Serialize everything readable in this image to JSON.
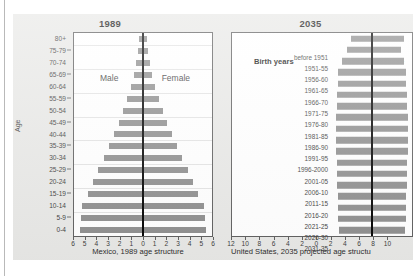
{
  "figure": {
    "background_color": "#e8e8e6",
    "bar_color": "#8d8d8d",
    "center_axis_color": "#000000"
  },
  "left_panel": {
    "title": "1989",
    "caption": "Mexico, 1989 age structure",
    "axis_title": "Age",
    "male_label": "Male",
    "female_label": "Female"
  },
  "right_panel": {
    "title": "2035",
    "caption": "United States, 2035 projected age structu",
    "birth_years_header": "Birth years",
    "male_label": "Male",
    "female_label": "Female"
  },
  "chart_data": [
    {
      "type": "bar",
      "title": "1989",
      "subtitle": "Mexico, 1989 age structure",
      "orientation": "horizontal-pyramid",
      "xlabel": "",
      "ylabel": "Age",
      "xlim": [
        -6,
        6
      ],
      "xticks": [
        "6",
        "5",
        "4",
        "3",
        "2",
        "1",
        "0",
        "1",
        "2",
        "3",
        "4",
        "5",
        "6"
      ],
      "grid": true,
      "legend": [
        "Male",
        "Female"
      ],
      "legend_position": "inside-top",
      "categories": [
        "80+",
        "75-79",
        "70-74",
        "65-69",
        "60-64",
        "55-59",
        "50-54",
        "45-49",
        "40-44",
        "35-39",
        "30-34",
        "25-29",
        "20-24",
        "15-19",
        "10-14",
        "5-9",
        "0-4"
      ],
      "series": [
        {
          "name": "Male",
          "values": [
            0.35,
            0.45,
            0.6,
            0.8,
            1.05,
            1.35,
            1.7,
            2.1,
            2.5,
            2.95,
            3.4,
            3.9,
            4.35,
            4.8,
            5.3,
            5.4,
            5.5
          ]
        },
        {
          "name": "Female",
          "values": [
            0.35,
            0.45,
            0.6,
            0.8,
            1.05,
            1.35,
            1.7,
            2.1,
            2.5,
            2.95,
            3.4,
            3.9,
            4.35,
            4.8,
            5.3,
            5.4,
            5.5
          ]
        }
      ]
    },
    {
      "type": "bar",
      "title": "2035",
      "subtitle": "United States, 2035 projected age structu",
      "orientation": "horizontal-pyramid",
      "xlabel": "",
      "ylabel": "Birth years",
      "xlim": [
        -12,
        12
      ],
      "xticks": [
        "12",
        "10",
        "8",
        "6",
        "4",
        "2",
        "0",
        "2",
        "4",
        "6",
        "8",
        "10"
      ],
      "grid": false,
      "legend": [
        "Male",
        "Female"
      ],
      "legend_position": "top",
      "categories": [
        "before 1951",
        "1951-55",
        "1956-60",
        "1961-65",
        "1966-70",
        "1971-75",
        "1976-80",
        "1981-85",
        "1986-90",
        "1991-95",
        "1996-2000",
        "2001-05",
        "2006-10",
        "2011-15",
        "2016-20",
        "2021-25",
        "2026-30",
        "2031-35"
      ],
      "series": [
        {
          "name": "Male",
          "values": [
            6.0,
            7.2,
            8.6,
            9.6,
            9.8,
            9.9,
            10.0,
            10.2,
            10.4,
            10.3,
            10.2,
            10.1,
            10.0,
            9.9,
            9.8,
            9.7,
            9.6,
            9.5
          ]
        },
        {
          "name": "Female",
          "values": [
            9.0,
            8.4,
            9.0,
            9.6,
            9.8,
            9.9,
            10.0,
            10.2,
            10.4,
            10.3,
            10.2,
            10.1,
            10.0,
            9.9,
            9.8,
            9.7,
            9.6,
            9.5
          ]
        }
      ]
    }
  ]
}
